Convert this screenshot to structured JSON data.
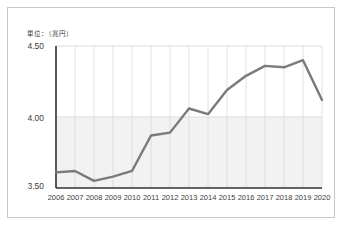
{
  "chart_data": {
    "type": "line",
    "title": "",
    "unit_label": "単位：（兆円）",
    "xlabel": "",
    "ylabel": "",
    "categories": [
      "2006",
      "2007",
      "2008",
      "2009",
      "2010",
      "2011",
      "2012",
      "2013",
      "2014",
      "2015",
      "2016",
      "2017",
      "2018",
      "2019",
      "2020"
    ],
    "values": [
      3.61,
      3.62,
      3.55,
      3.58,
      3.62,
      3.87,
      3.89,
      4.06,
      4.02,
      4.19,
      4.29,
      4.36,
      4.35,
      4.4,
      4.12
    ],
    "ylim": [
      3.5,
      4.5
    ],
    "yticks": [
      "3.50",
      "4.00",
      "4.50"
    ],
    "ytick_values": [
      3.5,
      4.0,
      4.5
    ],
    "grid": "vertical-light-and-horizontal-at-4.00",
    "legend": "none",
    "series_color": "#7a7a7a",
    "axis_color": "#333333"
  },
  "colors": {
    "line": "#7a7a7a",
    "axis": "#333333",
    "grid": "#d9d9d9",
    "band_fill": "#f2f2f2",
    "frame_border": "#c8c8c8",
    "text": "#3d3d3d"
  }
}
